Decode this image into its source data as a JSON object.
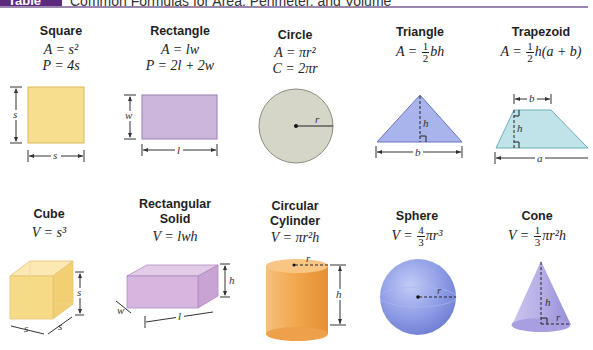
{
  "header": {
    "badge": "Table 1.6",
    "title": "Common Formulas for Area, Perimeter, and Volume",
    "badge_color": "#5b2a7e",
    "rule_color": "#9b86ad"
  },
  "area_shapes": [
    {
      "name": "Square",
      "formulas": [
        "A = s²",
        "P = 4s"
      ],
      "labels": {
        "side_v": "s",
        "side_h": "s"
      },
      "color": "#f7dd8e"
    },
    {
      "name": "Rectangle",
      "formulas": [
        "A = lw",
        "P = 2l + 2w"
      ],
      "labels": {
        "width": "w",
        "length": "l"
      },
      "color": "#cdb6dc"
    },
    {
      "name": "Circle",
      "formulas": [
        "A = πr²",
        "C = 2πr"
      ],
      "labels": {
        "radius": "r"
      },
      "color": "#d6d6c8"
    },
    {
      "name": "Triangle",
      "formula_prefix": "A = ",
      "frac": {
        "num": "1",
        "den": "2"
      },
      "formula_suffix": "bh",
      "labels": {
        "height": "h",
        "base": "b"
      },
      "color": "#a9b3ec"
    },
    {
      "name": "Trapezoid",
      "formula_prefix": "A = ",
      "frac": {
        "num": "1",
        "den": "2"
      },
      "formula_suffix": "h(a + b)",
      "labels": {
        "top": "b",
        "height": "h",
        "bottom": "a"
      },
      "color": "#bfe3e8"
    }
  ],
  "volume_shapes": [
    {
      "name": "Cube",
      "formulas": [
        "V = s³"
      ],
      "labels": {
        "height": "s",
        "front": "s",
        "side": "s"
      },
      "color": "#f6d98a"
    },
    {
      "name_lines": [
        "Rectangular",
        "Solid"
      ],
      "formulas": [
        "V = lwh"
      ],
      "labels": {
        "height": "h",
        "width": "w",
        "length": "l"
      },
      "color": "#d4b3dd"
    },
    {
      "name_lines": [
        "Circular",
        "Cylinder"
      ],
      "formulas": [
        "V = πr²h"
      ],
      "labels": {
        "radius": "r",
        "height": "h"
      },
      "color": "#f2aa55"
    },
    {
      "name": "Sphere",
      "formula_prefix": "V = ",
      "frac": {
        "num": "4",
        "den": "3"
      },
      "formula_suffix": "πr³",
      "labels": {
        "radius": "r"
      },
      "color": "#8f9ee8"
    },
    {
      "name": "Cone",
      "formula_prefix": "V = ",
      "frac": {
        "num": "1",
        "den": "3"
      },
      "formula_suffix": "πr²h",
      "labels": {
        "height": "h",
        "radius": "r"
      },
      "color": "#b9b3e6"
    }
  ]
}
